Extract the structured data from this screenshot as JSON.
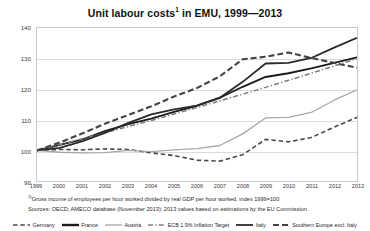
{
  "title": {
    "main": "Unit labour costs",
    "footnote_marker": "1",
    "rest": " in EMU, 1999—2013"
  },
  "notes": {
    "footnote_marker": "1)",
    "footnote": "Gross income of employees per hour worked divided by real GDP per hour worked, index 1999=100",
    "sources": "Sources: OECD; AMECO database (November 2013); 2013 values based on estimations by the EU Commission."
  },
  "chart_data": {
    "type": "line",
    "xlabel": "",
    "ylabel": "",
    "ylim": [
      90,
      140
    ],
    "yticks": [
      90,
      100,
      110,
      120,
      130,
      140
    ],
    "grid": true,
    "legend_position": "bottom",
    "x": [
      1999,
      2000,
      2001,
      2002,
      2003,
      2004,
      2005,
      2006,
      2007,
      2008,
      2009,
      2010,
      2011,
      2012,
      2013
    ],
    "categories": [
      "1999",
      "2000",
      "2001",
      "2002",
      "2003",
      "2004",
      "2005",
      "2006",
      "2007",
      "2008",
      "2009",
      "2010",
      "2011",
      "2012",
      "2013"
    ],
    "series": [
      {
        "name": "Germany",
        "color": "#4a4a4a",
        "style": "dashed",
        "width": 1.6,
        "values": [
          100,
          100.3,
          100.2,
          100.5,
          100.3,
          99.2,
          98.3,
          96.8,
          96.5,
          98.6,
          103.6,
          102.8,
          104.2,
          107.6,
          110.8
        ]
      },
      {
        "name": "France",
        "color": "#1c1c1c",
        "style": "solid",
        "width": 1.9,
        "values": [
          100,
          101.8,
          103.6,
          106.4,
          108.6,
          110.4,
          112.6,
          114.6,
          117.2,
          120.8,
          124.0,
          125.2,
          126.8,
          128.6,
          130.4
        ]
      },
      {
        "name": "Austria",
        "color": "#a8a8a8",
        "style": "solid",
        "width": 1.3,
        "values": [
          100,
          99.4,
          99.2,
          99.3,
          100.0,
          99.6,
          100.2,
          100.6,
          101.6,
          105.4,
          110.6,
          110.8,
          112.4,
          116.4,
          119.8
        ]
      },
      {
        "name": "ECB 1.9% Inflation Target",
        "color": "#7d7d7d",
        "style": "dashdot",
        "width": 1.5,
        "values": [
          100,
          101.9,
          103.8,
          105.8,
          107.8,
          109.8,
          111.9,
          114.0,
          116.2,
          118.4,
          120.6,
          122.9,
          125.2,
          127.6,
          130.0
        ]
      },
      {
        "name": "Italy",
        "color": "#2a2a2a",
        "style": "solid",
        "width": 1.8,
        "values": [
          100,
          100.8,
          103.0,
          105.8,
          109.0,
          111.8,
          113.4,
          114.6,
          117.2,
          122.4,
          128.4,
          128.6,
          130.2,
          133.6,
          136.8
        ]
      },
      {
        "name": "Southern Europe excl. Italy",
        "color": "#444444",
        "style": "dashed",
        "width": 2.1,
        "values": [
          100,
          102.6,
          105.6,
          108.8,
          111.6,
          114.4,
          117.6,
          120.4,
          124.2,
          129.8,
          130.6,
          132.0,
          130.2,
          128.6,
          127.0
        ]
      }
    ]
  },
  "legend": [
    {
      "label": "Germany",
      "style": "dashed",
      "color": "#4a4a4a",
      "width": 1.6
    },
    {
      "label": "France",
      "style": "solid",
      "color": "#1c1c1c",
      "width": 2.4
    },
    {
      "label": "Austria",
      "style": "solid",
      "color": "#a8a8a8",
      "width": 1.3
    },
    {
      "label": "ECB 1.9% Inflation Target",
      "style": "dashdot",
      "color": "#7d7d7d",
      "width": 1.5
    },
    {
      "label": "Italy",
      "style": "solid",
      "color": "#2a2a2a",
      "width": 1.8
    },
    {
      "label": "Southern Europe excl. Italy",
      "style": "dashed",
      "color": "#444444",
      "width": 2.1
    }
  ]
}
